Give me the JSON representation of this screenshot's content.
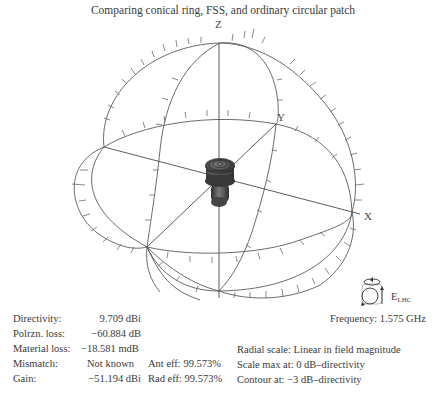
{
  "title": "Comparing conical ring, FSS, and ordinary circular patch",
  "axes": {
    "x": "X",
    "y": "Y",
    "z": "Z"
  },
  "stats": {
    "directivity": {
      "label": "Directivity:",
      "value": "9.709 dBi"
    },
    "polarization_loss": {
      "label": "Polrzn. loss:",
      "value": "−60.884 dB"
    },
    "material_loss": {
      "label": "Material loss:",
      "value": "−18.581 mdB"
    },
    "mismatch": {
      "label": "Mismatch:",
      "value": "Not known"
    },
    "gain": {
      "label": "Gain:",
      "value": "−51.194 dBi"
    }
  },
  "efficiency": {
    "ant_eff": "Ant eff: 99.573%",
    "rad_eff": "Rad eff: 99.573%"
  },
  "polarization": {
    "icon": "rotation-cube-icon",
    "label_main": "E",
    "label_sub": "LHC"
  },
  "frequency": "Frequency: 1.575 GHz",
  "scale": {
    "radial": "Radial scale:  Linear in field magnitude",
    "max": "Scale max at:  0 dB–directivity",
    "contour": "Contour at:  −3 dB–directivity"
  },
  "colors": {
    "wire": "#5a5a5a",
    "pattern": "#3c3c3c",
    "text": "#3a3a3a"
  }
}
